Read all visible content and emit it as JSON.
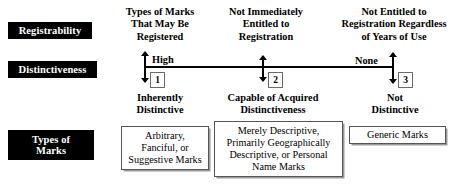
{
  "rows": [
    {
      "id": "registrability",
      "label": "Registrability"
    },
    {
      "id": "distinctiveness",
      "label": "Distinctiveness"
    },
    {
      "id": "types_of_marks",
      "label_line1": "Types of",
      "label_line2": "Marks"
    }
  ],
  "column_headings": [
    {
      "line1": "Types of Marks",
      "line2": "That May Be",
      "line3": "Registered"
    },
    {
      "line1": "Not Immediately",
      "line2": "Entitled to",
      "line3": "Registration"
    },
    {
      "line1": "Not Entitled to",
      "line2": "Registration Regardless",
      "line3": "of Years of Use"
    }
  ],
  "axis": {
    "high_label": "High",
    "none_label": "None",
    "markers": [
      {
        "number": "1"
      },
      {
        "number": "2"
      },
      {
        "number": "3"
      }
    ]
  },
  "tier_captions": [
    {
      "line1": "Inherently",
      "line2": "Distinctive"
    },
    {
      "line1": "Capable of Acquired",
      "line2": "Distinctiveness"
    },
    {
      "line1": "Not",
      "line2": "Distinctive"
    }
  ],
  "mark_boxes": [
    {
      "lines": [
        "Arbitrary,",
        "Fanciful, or",
        "Suggestive Marks"
      ]
    },
    {
      "lines": [
        "Merely Descriptive,",
        "Primarily Geographically",
        "Descriptive, or Personal",
        "Name Marks"
      ]
    },
    {
      "lines": [
        "Generic Marks"
      ]
    }
  ],
  "colors": {
    "label_chip_background": "#000000",
    "label_chip_text": "#ffffff",
    "axis_line": "#000000",
    "box_border": "#555555",
    "box_shadow": "#9a9a9a",
    "page_background": "#ffffff"
  }
}
